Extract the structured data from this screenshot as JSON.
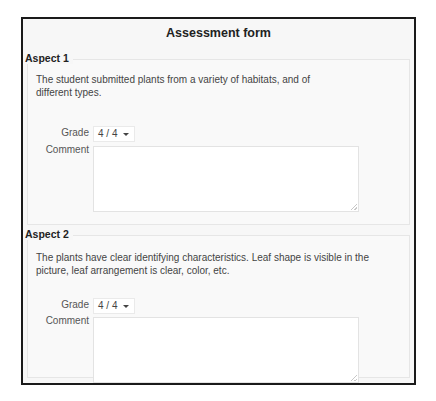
{
  "form": {
    "title": "Assessment form"
  },
  "aspects": [
    {
      "heading": "Aspect 1",
      "description": "The student submitted plants from a variety of habitats, and of different types.",
      "grade_label": "Grade",
      "grade_value": "4 / 4",
      "comment_label": "Comment",
      "comment_value": ""
    },
    {
      "heading": "Aspect 2",
      "description": "The plants have clear identifying characteristics. Leaf shape is visible in the picture, leaf arrangement is clear, color, etc.",
      "grade_label": "Grade",
      "grade_value": "4 / 4",
      "comment_label": "Comment",
      "comment_value": ""
    }
  ],
  "icons": {
    "grade_dropdown": "chevron-down-icon",
    "textarea_resize": "resize-grip-icon"
  },
  "colors": {
    "frame_border": "#1a1a1a",
    "background": "#f7f7f7",
    "text": "#333333"
  }
}
